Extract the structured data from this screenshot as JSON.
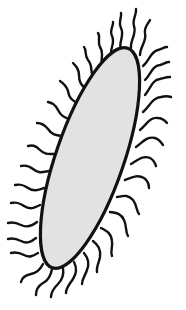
{
  "figure": {
    "colors": {
      "background": "#ffffff",
      "cell_fill": "#e2e2e2",
      "outline": "#111111",
      "flagella": "#111111"
    },
    "cell": {
      "shape": "ellipse",
      "center": [
        90,
        158
      ],
      "rx": 34,
      "ry": 116,
      "rotation_deg": 19
    },
    "flagella_count": 34
  }
}
